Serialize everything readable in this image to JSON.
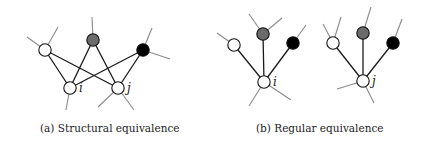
{
  "figure": {
    "panels": [
      {
        "id": "a",
        "caption": "(a) Structural equivalence",
        "nodes": [
          {
            "id": "w",
            "x": 45,
            "y": 50,
            "fill": "#ffffff"
          },
          {
            "id": "g",
            "x": 93,
            "y": 40,
            "fill": "#6b6b6b"
          },
          {
            "id": "b",
            "x": 143,
            "y": 50,
            "fill": "#000000"
          },
          {
            "id": "i",
            "x": 70,
            "y": 88,
            "fill": "#ffffff",
            "label": "i"
          },
          {
            "id": "j",
            "x": 118,
            "y": 88,
            "fill": "#ffffff",
            "label": "j"
          }
        ],
        "edges": [
          [
            "w",
            "i"
          ],
          [
            "w",
            "j"
          ],
          [
            "g",
            "i"
          ],
          [
            "g",
            "j"
          ],
          [
            "b",
            "i"
          ],
          [
            "b",
            "j"
          ]
        ],
        "stubs": [
          {
            "from": "w",
            "x2": 27,
            "y2": 37
          },
          {
            "from": "w",
            "x2": 58,
            "y2": 27
          },
          {
            "from": "g",
            "x2": 92,
            "y2": 17
          },
          {
            "from": "b",
            "x2": 152,
            "y2": 28
          },
          {
            "from": "b",
            "x2": 170,
            "y2": 59
          },
          {
            "from": "i",
            "x2": 66,
            "y2": 110
          },
          {
            "from": "j",
            "x2": 98,
            "y2": 107
          },
          {
            "from": "j",
            "x2": 134,
            "y2": 110
          }
        ]
      },
      {
        "id": "b",
        "caption": "(b) Regular equivalence",
        "nodes": [
          {
            "id": "w1",
            "x": 234,
            "y": 45,
            "fill": "#ffffff"
          },
          {
            "id": "g1",
            "x": 263,
            "y": 34,
            "fill": "#6b6b6b"
          },
          {
            "id": "b1",
            "x": 293,
            "y": 43,
            "fill": "#000000"
          },
          {
            "id": "i",
            "x": 264,
            "y": 82,
            "fill": "#ffffff",
            "label": "i"
          },
          {
            "id": "w2",
            "x": 333,
            "y": 43,
            "fill": "#ffffff"
          },
          {
            "id": "g2",
            "x": 363,
            "y": 33,
            "fill": "#6b6b6b"
          },
          {
            "id": "b2",
            "x": 393,
            "y": 43,
            "fill": "#000000"
          },
          {
            "id": "j",
            "x": 363,
            "y": 81,
            "fill": "#ffffff",
            "label": "j"
          }
        ],
        "edges": [
          [
            "w1",
            "i"
          ],
          [
            "g1",
            "i"
          ],
          [
            "b1",
            "i"
          ],
          [
            "w2",
            "j"
          ],
          [
            "g2",
            "j"
          ],
          [
            "b2",
            "j"
          ]
        ],
        "stubs": [
          {
            "from": "w1",
            "x2": 217,
            "y2": 33
          },
          {
            "from": "g1",
            "x2": 249,
            "y2": 14
          },
          {
            "from": "g1",
            "x2": 282,
            "y2": 18
          },
          {
            "from": "b1",
            "x2": 306,
            "y2": 25
          },
          {
            "from": "i",
            "x2": 249,
            "y2": 106
          },
          {
            "from": "i",
            "x2": 291,
            "y2": 100
          },
          {
            "from": "w2",
            "x2": 323,
            "y2": 24
          },
          {
            "from": "w2",
            "x2": 341,
            "y2": 17
          },
          {
            "from": "g2",
            "x2": 371,
            "y2": 7
          },
          {
            "from": "b2",
            "x2": 402,
            "y2": 19
          },
          {
            "from": "j",
            "x2": 337,
            "y2": 89
          },
          {
            "from": "j",
            "x2": 374,
            "y2": 103
          }
        ]
      }
    ]
  }
}
